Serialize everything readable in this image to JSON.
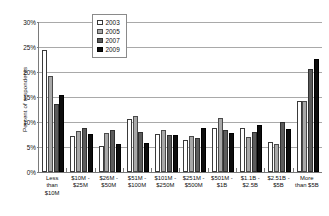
{
  "chart_data": {
    "type": "bar",
    "title": "",
    "xlabel": "",
    "ylabel": "Percent of respondents",
    "ylim": [
      0,
      30
    ],
    "ytick_labels": [
      "0%",
      "5%",
      "10%",
      "15%",
      "20%",
      "25%",
      "30%"
    ],
    "ytick_values": [
      0,
      5,
      10,
      15,
      20,
      25,
      30
    ],
    "grid": true,
    "legend_position": "top-center",
    "categories": [
      "Less than $10M",
      "$10M - $25M",
      "$26M - $50M",
      "$51M - $100M",
      "$101M - $250M",
      "$251M - $500M",
      "$501M - $1B",
      "$1.1B - $2.5B",
      "$2.51B - $5B",
      "More than $5B"
    ],
    "category_lines": [
      [
        "Less",
        "than",
        "$10M"
      ],
      [
        "$10M -",
        "$25M"
      ],
      [
        "$26M -",
        "$50M"
      ],
      [
        "$51M -",
        "$100M"
      ],
      [
        "$101M -",
        "$250M"
      ],
      [
        "$251M -",
        "$500M"
      ],
      [
        "$501M -",
        "$1B"
      ],
      [
        "$1.1B -",
        "$2.5B"
      ],
      [
        "$2.51B -",
        "$5B"
      ],
      [
        "More",
        "than $5B"
      ]
    ],
    "series": [
      {
        "name": "2003",
        "color": "#ffffff",
        "values": [
          24.5,
          7.2,
          5.3,
          10.7,
          7.7,
          6.5,
          8.9,
          8.9,
          6.0,
          14.2
        ]
      },
      {
        "name": "2005",
        "color": "#a8a8a8",
        "values": [
          19.3,
          8.2,
          7.8,
          11.2,
          8.4,
          7.2,
          10.9,
          7.1,
          5.6,
          14.2
        ]
      },
      {
        "name": "2007",
        "color": "#5c5c5c",
        "values": [
          13.6,
          8.9,
          8.5,
          8.0,
          7.5,
          6.8,
          8.5,
          8.0,
          10.0,
          20.7
        ]
      },
      {
        "name": "2009",
        "color": "#0d0d0d",
        "values": [
          15.5,
          7.6,
          5.7,
          5.9,
          7.4,
          8.9,
          7.9,
          9.5,
          8.7,
          22.7
        ]
      }
    ]
  },
  "legend": {
    "entries": [
      {
        "label": "2003"
      },
      {
        "label": "2005"
      },
      {
        "label": "2007"
      },
      {
        "label": "2009"
      }
    ]
  }
}
